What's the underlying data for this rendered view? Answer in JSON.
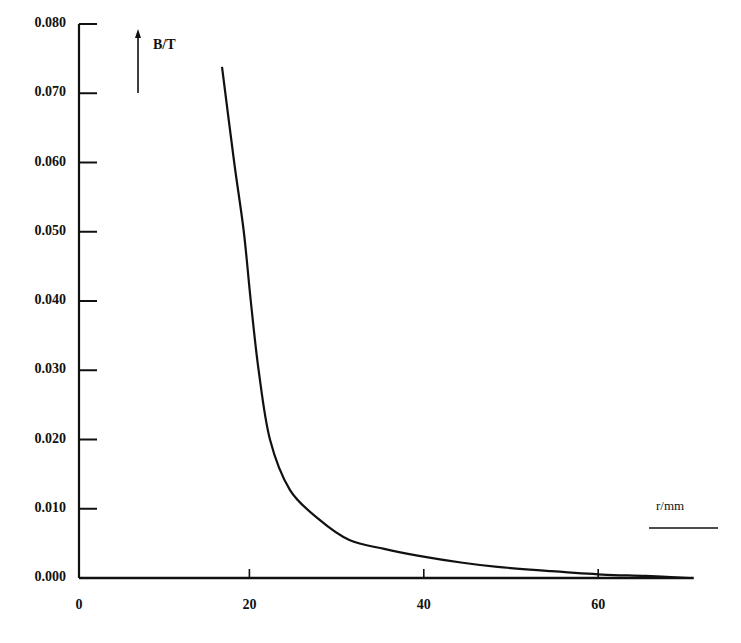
{
  "chart_data": {
    "type": "line",
    "title": "",
    "xlabel": "r/mm",
    "ylabel": "B/T",
    "xlim": [
      0,
      70
    ],
    "ylim": [
      0,
      0.08
    ],
    "grid": false,
    "legend": null,
    "x_ticks": [
      0,
      20,
      40,
      60
    ],
    "x_tick_labels": [
      "0",
      "20",
      "40",
      "60"
    ],
    "y_ticks": [
      0.0,
      0.01,
      0.02,
      0.03,
      0.04,
      0.05,
      0.06,
      0.07,
      0.08
    ],
    "y_tick_labels": [
      "0.000",
      "0.010",
      "0.020",
      "0.030",
      "0.040",
      "0.050",
      "0.060",
      "0.070",
      "0.080"
    ],
    "series": [
      {
        "name": "B(r)",
        "x": [
          16.4,
          17.8,
          18.9,
          19.7,
          20.6,
          21.9,
          24.2,
          27.6,
          31.0,
          35.0,
          39.0,
          44.0,
          48.0,
          54.0,
          60.0,
          65.0,
          70.0
        ],
        "values": [
          0.0738,
          0.06,
          0.05,
          0.04,
          0.03,
          0.02,
          0.0127,
          0.0084,
          0.0055,
          0.0042,
          0.0032,
          0.0022,
          0.0016,
          0.001,
          0.0005,
          0.0003,
          0.0
        ]
      }
    ]
  },
  "labels": {
    "ylabel": "B/T",
    "xlabel": "r/mm"
  }
}
